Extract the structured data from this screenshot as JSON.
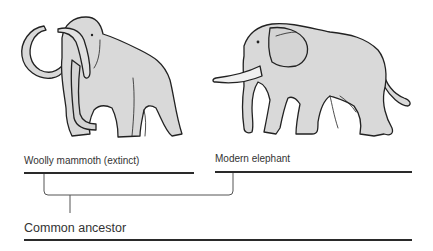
{
  "diagram": {
    "type": "phylogenetic-tree",
    "nodes": {
      "mammoth": {
        "label": "Woolly mammoth (extinct)"
      },
      "elephant": {
        "label": "Modern elephant"
      },
      "ancestor": {
        "label": "Common ancestor"
      }
    },
    "edges": [
      {
        "from": "ancestor",
        "to": "mammoth"
      },
      {
        "from": "ancestor",
        "to": "elephant"
      }
    ],
    "colors": {
      "animal_fill": "#d9d9d9",
      "outline": "#222222",
      "line": "#2a2a2a",
      "text": "#333333"
    }
  }
}
